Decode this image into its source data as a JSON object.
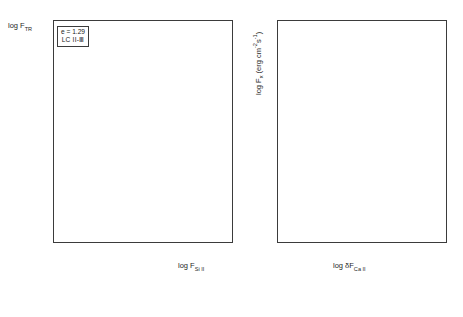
{
  "figure": {
    "type": "two-panel-scatter",
    "background": "#ffffff",
    "axis_color": "#3b3b3b"
  },
  "left_panel": {
    "legend": {
      "line1": "e = 1.29",
      "line2": "LC II-Ⅲ"
    },
    "annotations": [
      {
        "text": "FX",
        "x": 6.22,
        "y": 6.93
      },
      {
        "text": "ER",
        "x": 5.82,
        "y": 6.44
      },
      {
        "text": "W",
        "x": 5.63,
        "y": 6.28
      },
      {
        "text": "D",
        "x": 6.17,
        "y": 6.3
      },
      {
        "text": "PR",
        "x": 6.17,
        "y": 6.19
      },
      {
        "text": "XX",
        "x": 4.72,
        "y": 5.62
      },
      {
        "text": "W",
        "x": 4.92,
        "y": 5.66
      }
    ]
  },
  "right_panel": {},
  "chart_data": [
    {
      "type": "scatter",
      "panel": "left",
      "title": "",
      "xlabel": "log F_Si II",
      "ylabel": "log F_TR",
      "xlim": [
        2.55,
        6.55
      ],
      "ylim": [
        1.72,
        7.0
      ],
      "xticks": [
        3,
        4,
        5,
        6
      ],
      "yticks": [
        2,
        3,
        4,
        5,
        6,
        7
      ],
      "xtick_labels": [
        "3",
        "4",
        "5",
        "6"
      ],
      "ytick_labels": [
        "2",
        "3",
        "4",
        "5",
        "6",
        "7"
      ],
      "minor_ticks": true,
      "grid": false,
      "legend_position": "upper-left-inset",
      "fit_line": {
        "style": "solid",
        "x": [
          2.72,
          6.05
        ],
        "y": [
          1.93,
          6.32
        ]
      },
      "extension_line": {
        "style": "dashed",
        "x": [
          6.05,
          6.3
        ],
        "y": [
          6.32,
          6.86
        ]
      },
      "series": [
        {
          "name": "filled-square",
          "marker": "m-fs",
          "points": [
            [
              2.72,
              1.8
            ],
            [
              2.74,
              1.86
            ],
            [
              2.76,
              1.78
            ],
            [
              2.78,
              1.92
            ],
            [
              2.8,
              2.02
            ],
            [
              2.82,
              1.84
            ],
            [
              2.86,
              2.38
            ],
            [
              2.9,
              2.5
            ],
            [
              2.95,
              2.62
            ],
            [
              3.0,
              2.74
            ],
            [
              3.04,
              2.58
            ],
            [
              3.1,
              2.88
            ],
            [
              3.16,
              3.02
            ],
            [
              3.22,
              3.1
            ],
            [
              3.3,
              3.22
            ],
            [
              3.36,
              3.34
            ],
            [
              3.42,
              3.28
            ],
            [
              3.48,
              3.44
            ],
            [
              3.54,
              3.52
            ],
            [
              3.6,
              3.48
            ],
            [
              3.66,
              3.62
            ],
            [
              3.72,
              3.7
            ],
            [
              3.8,
              3.78
            ],
            [
              3.88,
              3.84
            ],
            [
              3.94,
              3.74
            ],
            [
              4.02,
              3.96
            ],
            [
              4.1,
              4.06
            ],
            [
              4.18,
              4.12
            ],
            [
              4.26,
              4.24
            ],
            [
              4.34,
              4.34
            ],
            [
              4.42,
              4.46
            ],
            [
              4.52,
              4.62
            ],
            [
              4.6,
              4.7
            ],
            [
              4.68,
              4.82
            ],
            [
              4.74,
              4.96
            ],
            [
              4.82,
              5.04
            ],
            [
              4.9,
              5.18
            ],
            [
              4.96,
              5.26
            ],
            [
              5.04,
              5.3
            ],
            [
              5.58,
              6.08
            ],
            [
              5.64,
              6.12
            ],
            [
              5.7,
              6.14
            ],
            [
              5.76,
              6.16
            ],
            [
              5.8,
              6.18
            ],
            [
              5.86,
              6.2
            ],
            [
              5.92,
              6.22
            ],
            [
              6.2,
              6.84
            ],
            [
              6.14,
              6.22
            ]
          ]
        },
        {
          "name": "filled-circle",
          "marker": "m-fc",
          "points": [
            [
              3.34,
              3.26
            ],
            [
              3.52,
              3.4
            ],
            [
              3.7,
              3.6
            ],
            [
              3.86,
              3.72
            ],
            [
              4.04,
              3.9
            ],
            [
              4.16,
              4.04
            ],
            [
              4.3,
              4.18
            ],
            [
              4.46,
              4.4
            ],
            [
              4.58,
              4.58
            ],
            [
              4.72,
              4.76
            ],
            [
              4.86,
              5.0
            ],
            [
              4.4,
              4.3
            ],
            [
              4.64,
              4.64
            ],
            [
              3.62,
              3.56
            ],
            [
              3.44,
              3.36
            ]
          ]
        },
        {
          "name": "open-circle",
          "marker": "m-oc",
          "points": [
            [
              4.04,
              4.3
            ],
            [
              4.3,
              4.32
            ],
            [
              4.52,
              4.5
            ],
            [
              4.62,
              4.52
            ],
            [
              4.76,
              4.66
            ],
            [
              4.84,
              4.7
            ],
            [
              4.94,
              4.78
            ],
            [
              5.0,
              4.86
            ],
            [
              5.1,
              4.94
            ],
            [
              5.14,
              5.02
            ],
            [
              5.22,
              5.1
            ],
            [
              4.6,
              4.48
            ],
            [
              4.44,
              4.44
            ],
            [
              5.06,
              5.2
            ],
            [
              4.88,
              4.86
            ]
          ]
        },
        {
          "name": "open-square",
          "marker": "m-os",
          "points": [
            [
              4.4,
              5.0
            ],
            [
              4.7,
              5.2
            ],
            [
              4.86,
              5.42
            ],
            [
              4.98,
              5.5
            ],
            [
              5.04,
              5.58
            ],
            [
              5.12,
              5.64
            ],
            [
              5.26,
              5.66
            ],
            [
              4.54,
              5.34
            ],
            [
              5.18,
              5.7
            ],
            [
              4.36,
              4.76
            ],
            [
              4.62,
              4.92
            ],
            [
              5.3,
              5.86
            ],
            [
              4.18,
              5.0
            ],
            [
              4.74,
              5.96
            ]
          ]
        },
        {
          "name": "crossed-square",
          "marker": "m-cs",
          "points": [
            [
              4.72,
              5.62
            ],
            [
              4.8,
              5.62
            ],
            [
              5.46,
              6.12
            ],
            [
              5.52,
              6.14
            ],
            [
              5.58,
              6.28
            ],
            [
              4.34,
              5.96
            ],
            [
              4.22,
              4.48
            ],
            [
              4.44,
              4.46
            ]
          ]
        },
        {
          "name": "filled-triangle-up",
          "marker": "m-ft",
          "points": [
            [
              2.78,
              2.08
            ],
            [
              2.86,
              2.26
            ],
            [
              2.94,
              2.44
            ],
            [
              3.06,
              2.66
            ],
            [
              3.18,
              2.86
            ],
            [
              3.28,
              3.0
            ],
            [
              3.4,
              3.18
            ],
            [
              3.56,
              3.38
            ],
            [
              3.74,
              3.58
            ],
            [
              3.92,
              3.8
            ],
            [
              4.08,
              3.98
            ],
            [
              4.24,
              4.16
            ],
            [
              4.38,
              4.32
            ],
            [
              4.5,
              4.52
            ],
            [
              4.66,
              4.74
            ],
            [
              4.78,
              4.9
            ]
          ]
        },
        {
          "name": "filled-triangle-down",
          "marker": "m-fd",
          "points": [
            [
              3.82,
              3.66
            ],
            [
              4.0,
              3.86
            ],
            [
              4.12,
              4.0
            ],
            [
              4.28,
              4.14
            ],
            [
              4.48,
              4.42
            ],
            [
              4.56,
              4.54
            ],
            [
              3.96,
              3.88
            ],
            [
              4.2,
              4.08
            ]
          ]
        },
        {
          "name": "upper-limit-arrow",
          "marker": "arrow",
          "points": [
            [
              3.2,
              4.38
            ],
            [
              3.68,
              3.58
            ],
            [
              3.74,
              3.3
            ],
            [
              4.06,
              3.62
            ],
            [
              4.34,
              4.1
            ],
            [
              4.36,
              4.74
            ],
            [
              4.52,
              4.94
            ],
            [
              4.6,
              5.18
            ],
            [
              2.8,
              2.0
            ],
            [
              4.14,
              4.3
            ],
            [
              3.56,
              3.0
            ],
            [
              4.24,
              4.56
            ]
          ]
        }
      ]
    },
    {
      "type": "scatter",
      "panel": "right",
      "title": "",
      "xlabel": "log δF_Ca II",
      "ylabel": "log F_x (erg cm⁻² s⁻¹)",
      "xlim": [
        -1.55,
        1.58
      ],
      "ylim": [
        3.0,
        7.35
      ],
      "xticks": [
        -1,
        0,
        1
      ],
      "yticks": [
        3,
        4,
        5,
        6,
        7
      ],
      "xtick_labels": [
        "-1",
        "0",
        "1"
      ],
      "ytick_labels": [
        "3",
        "4",
        "5",
        "6",
        "7"
      ],
      "minor_ticks": true,
      "grid": false,
      "legend_position": "none",
      "fit_line": {
        "style": "solid",
        "x": [
          -1.3,
          0.92
        ],
        "y": [
          3.72,
          7.22
        ]
      },
      "series": [
        {
          "name": "half-filled-circle",
          "marker": "m-hc",
          "points": [
            [
              0.36,
              6.96
            ],
            [
              0.26,
              6.86
            ],
            [
              0.22,
              6.58
            ],
            [
              0.3,
              6.44
            ],
            [
              0.2,
              6.3
            ],
            [
              0.16,
              6.14
            ],
            [
              0.1,
              6.1
            ],
            [
              0.06,
              6.0
            ],
            [
              0.0,
              5.94
            ],
            [
              -0.06,
              5.84
            ],
            [
              -0.3,
              5.18
            ],
            [
              -0.46,
              5.12
            ],
            [
              -0.26,
              4.9
            ],
            [
              0.04,
              6.12
            ],
            [
              0.14,
              6.2
            ],
            [
              -0.16,
              5.44
            ],
            [
              0.4,
              6.2
            ],
            [
              0.24,
              6.06
            ]
          ]
        },
        {
          "name": "open-circle",
          "marker": "m-oc",
          "points": [
            [
              0.6,
              6.32
            ],
            [
              0.52,
              6.14
            ],
            [
              0.46,
              6.02
            ],
            [
              0.4,
              5.88
            ],
            [
              0.34,
              5.76
            ],
            [
              0.28,
              5.72
            ],
            [
              0.22,
              5.7
            ],
            [
              0.16,
              5.66
            ],
            [
              0.1,
              5.62
            ],
            [
              0.66,
              6.3
            ],
            [
              0.56,
              6.06
            ],
            [
              0.5,
              5.9
            ],
            [
              0.3,
              5.6
            ],
            [
              -0.38,
              5.04
            ],
            [
              -0.08,
              5.14
            ],
            [
              0.2,
              5.16
            ],
            [
              0.44,
              6.26
            ],
            [
              0.36,
              6.1
            ],
            [
              0.08,
              5.88
            ],
            [
              0.02,
              5.8
            ]
          ]
        },
        {
          "name": "filled-square",
          "marker": "m-fs",
          "points": [
            [
              0.12,
              6.16
            ],
            [
              0.16,
              6.18
            ],
            [
              0.18,
              6.12
            ],
            [
              0.06,
              5.88
            ],
            [
              0.02,
              5.84
            ],
            [
              -0.02,
              5.74
            ],
            [
              -0.24,
              5.46
            ],
            [
              0.08,
              6.14
            ],
            [
              0.1,
              6.08
            ]
          ]
        },
        {
          "name": "open-square",
          "marker": "m-os",
          "points": [
            [
              -0.1,
              5.8
            ],
            [
              -0.14,
              5.78
            ],
            [
              -0.18,
              5.76
            ],
            [
              0.0,
              5.98
            ],
            [
              0.04,
              6.02
            ],
            [
              -0.52,
              4.96
            ],
            [
              -0.6,
              4.72
            ],
            [
              0.02,
              5.9
            ],
            [
              -0.04,
              5.86
            ],
            [
              -0.48,
              5.38
            ]
          ]
        },
        {
          "name": "filled-triangle-up",
          "marker": "m-ft",
          "points": [
            [
              -0.06,
              6.14
            ],
            [
              -0.12,
              6.02
            ],
            [
              -0.2,
              5.9
            ],
            [
              -0.34,
              5.5
            ],
            [
              -0.66,
              4.64
            ],
            [
              -1.02,
              5.4
            ],
            [
              -1.06,
              4.46
            ],
            [
              -1.0,
              4.18
            ],
            [
              -0.3,
              5.84
            ]
          ]
        }
      ]
    }
  ]
}
